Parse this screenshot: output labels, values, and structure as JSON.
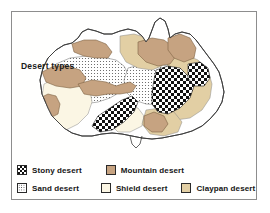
{
  "figure": {
    "title": "Desert types"
  },
  "colors": {
    "frame_border": "#8d8d8d",
    "coastline": "#3c3c3c",
    "mountain_desert": "#c6a381",
    "shield_desert": "#fbf6e4",
    "claypan_desert": "#e2cfa4",
    "sand_desert_dot": "#3a3a3a",
    "stony_desert_dark": "#111111",
    "background": "#ffffff",
    "text": "#141414"
  },
  "legend": {
    "rows": [
      {
        "entries": [
          {
            "label": "Stony desert",
            "pattern": "checkerboard",
            "swatch_class": "fill-stony",
            "offset": 5,
            "gap": 94
          },
          {
            "label": "Mountain desert",
            "pattern": "solid",
            "swatch_class": "fill-mountain",
            "offset": 99,
            "gap": 0
          }
        ]
      },
      {
        "entries": [
          {
            "label": "Sand desert",
            "pattern": "stipple",
            "swatch_class": "fill-sand",
            "offset": 5,
            "gap": 0
          },
          {
            "label": "Shield desert",
            "pattern": "solid",
            "swatch_class": "fill-shield",
            "offset": 90,
            "gap": 0
          },
          {
            "label": "Claypan desert",
            "pattern": "solid",
            "swatch_class": "fill-claypan",
            "offset": 178,
            "gap": 0
          }
        ]
      }
    ]
  },
  "map_regions": [
    {
      "name": "mountain-desert-northwest",
      "type": "Mountain desert"
    },
    {
      "name": "mountain-desert-west-coast",
      "type": "Mountain desert"
    },
    {
      "name": "mountain-desert-north-central",
      "type": "Mountain desert"
    },
    {
      "name": "mountain-desert-northeast",
      "type": "Mountain desert"
    },
    {
      "name": "mountain-desert-central",
      "type": "Mountain desert"
    },
    {
      "name": "mountain-desert-southeast",
      "type": "Mountain desert"
    },
    {
      "name": "shield-desert-west",
      "type": "Shield desert"
    },
    {
      "name": "sand-desert-central-west",
      "type": "Sand desert"
    },
    {
      "name": "sand-desert-central-east",
      "type": "Sand desert"
    },
    {
      "name": "claypan-desert-north",
      "type": "Claypan desert"
    },
    {
      "name": "claypan-desert-east",
      "type": "Claypan desert"
    },
    {
      "name": "stony-desert-south-central",
      "type": "Stony desert"
    },
    {
      "name": "stony-desert-east",
      "type": "Stony desert"
    }
  ]
}
